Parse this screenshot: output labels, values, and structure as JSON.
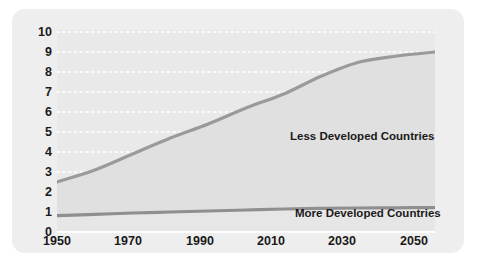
{
  "chart_data": {
    "type": "area",
    "title": "",
    "subtitle": "",
    "xlabel": "",
    "ylabel": "",
    "xlim": [
      1950,
      2050
    ],
    "ylim": [
      0,
      10
    ],
    "grid": "horizontal-dotted-white",
    "legend_position": "inline-annotations",
    "x_ticks": [
      "1950",
      "1970",
      "1990",
      "2010",
      "2030",
      "2050"
    ],
    "y_ticks": [
      "0",
      "1",
      "2",
      "3",
      "4",
      "5",
      "6",
      "7",
      "8",
      "9",
      "10"
    ],
    "x": [
      1950,
      1960,
      1970,
      1980,
      1990,
      2000,
      2010,
      2020,
      2030,
      2040,
      2050
    ],
    "series": [
      {
        "name": "Less Developed Countries",
        "color": "#9a9a9a",
        "fill": "#e0e0e0",
        "values": [
          2.5,
          3.1,
          3.9,
          4.7,
          5.4,
          6.2,
          6.9,
          7.8,
          8.5,
          8.8,
          9.0
        ]
      },
      {
        "name": "More Developed Countries",
        "color": "#8f8f8f",
        "fill": "#e6e6e6",
        "values": [
          0.82,
          0.88,
          0.95,
          1.0,
          1.05,
          1.1,
          1.15,
          1.18,
          1.2,
          1.21,
          1.22
        ]
      }
    ],
    "annotations": [
      {
        "text": "Less Developed Countries"
      },
      {
        "text": "More Developed Countries"
      }
    ],
    "colors": {
      "card_background": "#eeeeee",
      "plot_background": "#e9e9e9",
      "gridline": "#ffffff",
      "axis_text": "#1a1a1a",
      "line_upper": "#9a9a9a",
      "line_lower": "#8f8f8f",
      "page_background": "#ffffff"
    }
  }
}
